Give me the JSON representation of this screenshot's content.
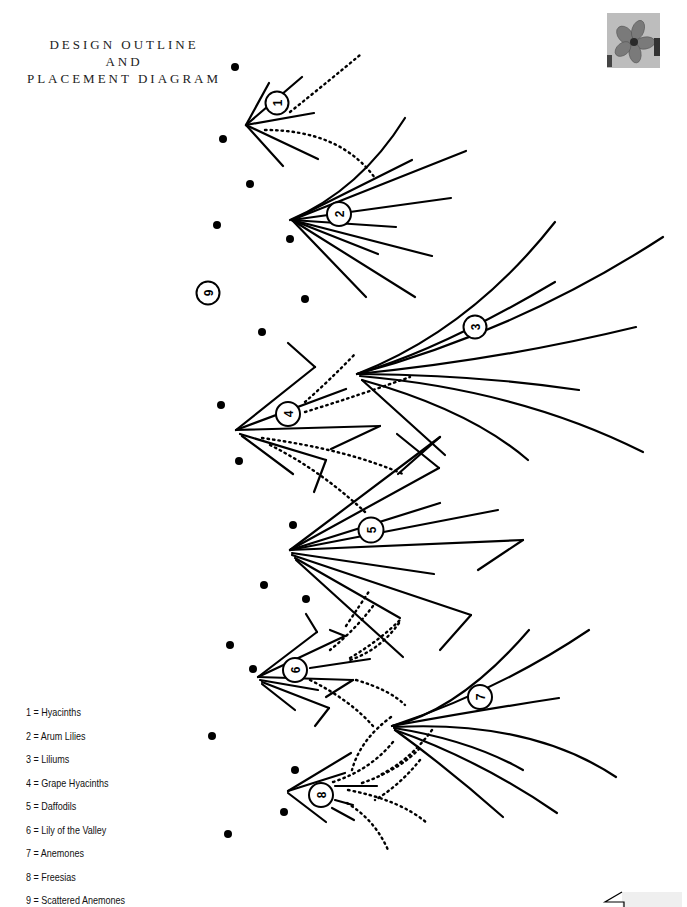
{
  "title": {
    "lines": [
      "DESIGN OUTLINE",
      "AND",
      "PLACEMENT DIAGRAM"
    ]
  },
  "thumbnail": {
    "icon": "flower-photo-thumbnail"
  },
  "markers": [
    {
      "id": "1",
      "label": "1"
    },
    {
      "id": "2",
      "label": "2"
    },
    {
      "id": "3",
      "label": "3"
    },
    {
      "id": "4",
      "label": "4"
    },
    {
      "id": "5",
      "label": "5"
    },
    {
      "id": "6",
      "label": "6"
    },
    {
      "id": "7",
      "label": "7"
    },
    {
      "id": "8",
      "label": "8"
    },
    {
      "id": "9",
      "label": "9"
    }
  ],
  "legend": [
    {
      "number": "1",
      "text": "1 = Hyacinths"
    },
    {
      "number": "2",
      "text": "2 = Arum Lilies"
    },
    {
      "number": "3",
      "text": "3 = Liliums"
    },
    {
      "number": "4",
      "text": "4 = Grape Hyacinths"
    },
    {
      "number": "5",
      "text": "5 = Daffodils"
    },
    {
      "number": "6",
      "text": "6 = Lily of the Valley"
    },
    {
      "number": "7",
      "text": "7 = Anemones"
    },
    {
      "number": "8",
      "text": "8 = Freesias"
    },
    {
      "number": "9",
      "text": "9 = Scattered Anemones"
    }
  ]
}
